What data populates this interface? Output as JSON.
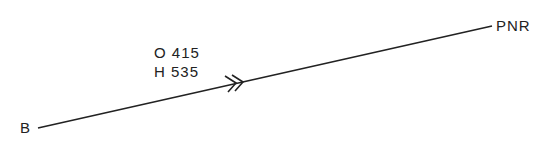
{
  "diagram": {
    "start_label": "B",
    "end_label": "PNR",
    "annotation": {
      "line1": "O 415",
      "line2": "H 535"
    },
    "line_color": "#222222",
    "direction_marker": "double-chevron-arrow"
  }
}
